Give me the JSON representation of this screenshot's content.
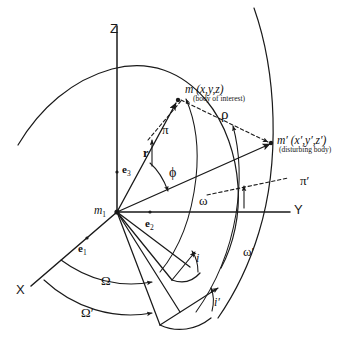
{
  "figure": {
    "type": "celestial-mechanics-geometry-diagram"
  },
  "axes": {
    "z": "Z",
    "y": "Y",
    "x": "X"
  },
  "origin": {
    "label": "m",
    "subscript": "1"
  },
  "basis_vectors": [
    {
      "name": "e",
      "subscript": "3",
      "axis": "Z"
    },
    {
      "name": "e",
      "subscript": "2",
      "axis": "Y"
    },
    {
      "name": "e",
      "subscript": "1",
      "axis": "X"
    }
  ],
  "bodies": [
    {
      "id": "body-of-interest",
      "symbol": "m",
      "coordinates": "(x,y,z)",
      "note": "(body of interest)"
    },
    {
      "id": "disturbing-body",
      "symbol": "m′",
      "coordinates": "(x′,y′,z′)",
      "note": "(disturbing body)"
    }
  ],
  "vectors": {
    "radius": "r",
    "separation": "ρ"
  },
  "angles": {
    "phi": "ϕ",
    "omega": "ω",
    "omega_prime": "ω′",
    "inclination": "i",
    "inclination_prime": "i′",
    "node": "Ω",
    "node_prime": "Ω′"
  },
  "perihelion_directions": {
    "pi": "π",
    "pi_prime": "π′"
  },
  "colors": {
    "line": "#1a1a1a",
    "background": "#ffffff",
    "text": "#111111"
  }
}
